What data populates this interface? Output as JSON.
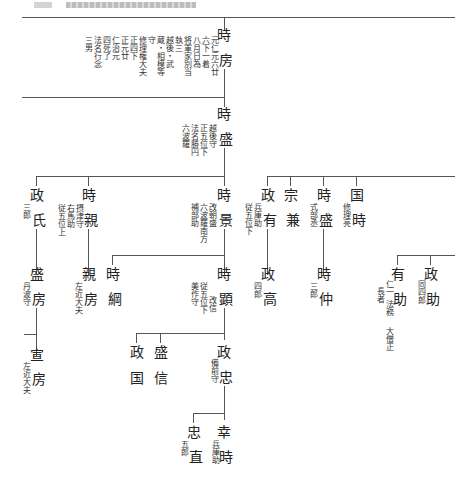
{
  "page": {
    "header_text": "(illegible running header)"
  },
  "genealogy": {
    "tokifusa": {
      "name_top": "時",
      "name_bottom": "房",
      "notes": [
        "元仁元六廿",
        "六下一着",
        "八月日為",
        "将軍家別当",
        "執三",
        "越後・武",
        "蔵・相模等",
        "守",
        "修理権大夫",
        "正四下",
        "正元廿",
        "仁治元",
        "四死了",
        "法名行念",
        "三男"
      ]
    },
    "tokimori": {
      "name_top": "時",
      "name_bottom": "盛",
      "notes": [
        "越後守",
        "正五位下",
        "法名勝円",
        "六波羅"
      ]
    },
    "masauji": {
      "name_top": "政",
      "name_bottom": "氏",
      "note": "三郎"
    },
    "tokichika": {
      "name_top": "時",
      "name_bottom": "親",
      "notes": [
        "摂津守",
        "右馬助",
        "従五位上"
      ]
    },
    "tokikage": {
      "name_top": "時",
      "name_bottom": "景",
      "notes": [
        "改朝盛",
        "六波羅南方",
        "補部助"
      ]
    },
    "masaari": {
      "name_top": "政",
      "name_bottom": "有",
      "notes": [
        "兵庫助",
        "従五位下"
      ]
    },
    "munekane": {
      "name_top": "宗",
      "name_bottom": "兼"
    },
    "tokimori2": {
      "name_top": "時",
      "name_bottom": "盛",
      "note": "式部丞"
    },
    "kunitoki": {
      "name_top": "国",
      "name_bottom": "時",
      "note": "修理亮"
    },
    "morifusa": {
      "name_top": "盛",
      "name_bottom": "房",
      "note": "丹波守"
    },
    "chikafusa": {
      "name_top": "親",
      "name_bottom": "房",
      "note": "左近大夫"
    },
    "tokitsuna": {
      "name_top": "時",
      "name_bottom": "綱"
    },
    "tokiaki": {
      "name_top": "時",
      "name_bottom": "顕",
      "notes": [
        "従五位下",
        "美作守",
        "改信"
      ]
    },
    "masataka": {
      "name_top": "政",
      "name_bottom": "高",
      "note": "四郎"
    },
    "tokinaka": {
      "name_top": "時",
      "name_bottom": "仲",
      "note": "三郎"
    },
    "arisuke": {
      "name_top": "有",
      "name_bottom": "助",
      "notes": [
        "仁一",
        "長者",
        "法務",
        "大僧正"
      ]
    },
    "masasuke": {
      "name_top": "政",
      "name_bottom": "助",
      "note": "同四郎"
    },
    "nobufusa": {
      "name_top": "宣",
      "name_bottom": "房",
      "note": "左近大夫"
    },
    "masakuni": {
      "name_top": "政",
      "name_bottom": "国"
    },
    "morinobu": {
      "name_top": "盛",
      "name_bottom": "信"
    },
    "masatada": {
      "name_top": "政",
      "name_bottom": "忠",
      "note": "備前守"
    },
    "tadanao": {
      "name_top": "忠",
      "name_bottom": "直",
      "note": "五郎"
    },
    "yukitoki": {
      "name_top": "幸",
      "name_bottom": "時",
      "note": "兵庫助"
    }
  }
}
